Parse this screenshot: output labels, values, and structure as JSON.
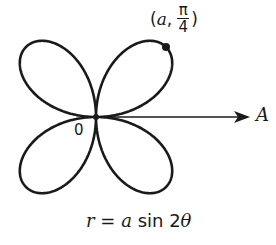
{
  "diagram": {
    "type": "polar-rose",
    "equation": {
      "lhs": "r",
      "eq": "=",
      "rhs_coef": "a",
      "rhs_func": "sin 2",
      "rhs_var": "θ"
    },
    "point_label": {
      "open": "(",
      "coord_r": "a",
      "sep": ",",
      "num": "π",
      "den": "4",
      "close": ")"
    },
    "origin_label": "0",
    "polar_axis_label": "A",
    "colors": {
      "stroke": "#1a1a1a",
      "background": "#ffffff"
    },
    "geometry": {
      "origin": [
        96,
        117
      ],
      "a_px": 99,
      "petals": 4,
      "highlight_point_angle": "π/4"
    }
  }
}
